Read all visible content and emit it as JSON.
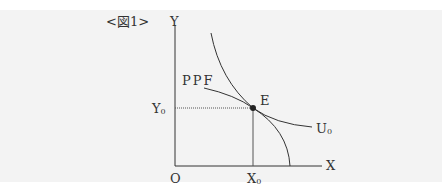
{
  "figure": {
    "caption": "<図1>",
    "axes": {
      "y_label": "Y",
      "x_label": "X",
      "origin_label": "O"
    },
    "curves": {
      "ppf_label": "PPF",
      "indifference_label": "U",
      "indifference_sub": "0"
    },
    "point": {
      "label": "E"
    },
    "ticks": {
      "y0_main": "Y",
      "y0_sub": "0",
      "x0_main": "X",
      "x0_sub": "0"
    }
  },
  "colors": {
    "background": "#f3f3f3",
    "line": "#333333"
  }
}
